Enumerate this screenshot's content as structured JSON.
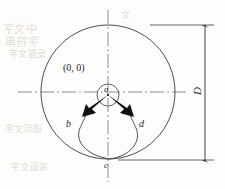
{
  "figure": {
    "labels": {
      "origin": "(0, 0)",
      "point_a": "a",
      "point_b": "b",
      "point_c": "c",
      "point_d": "d",
      "dimension_D": "D"
    },
    "colors": {
      "line": "#3a3a3a",
      "axis": "#6f6f6f",
      "arrow": "#111111",
      "background": "#fdfdfb",
      "bleed_text": "#cfc2bd"
    },
    "geometry": {
      "large_circle": {
        "cx": 108,
        "cy": 92,
        "r": 67
      },
      "small_circle": {
        "cx": 108,
        "cy": 95,
        "r": 11
      },
      "center_point": {
        "x": 108,
        "y": 95
      },
      "point_b": {
        "x": 80,
        "y": 128
      },
      "point_c": {
        "x": 110,
        "y": 159
      },
      "point_d": {
        "x": 136,
        "y": 128
      },
      "arrow_left_tip": {
        "x": 83,
        "y": 116
      },
      "arrow_right_tip": {
        "x": 133,
        "y": 116
      },
      "horizontal_axis": {
        "x1": 18,
        "x2": 186,
        "y": 92
      },
      "vertical_axis": {
        "x": 108,
        "y1": 10,
        "y2": 182
      },
      "dimension_line": {
        "x": 205,
        "y1": 25,
        "y2": 160
      },
      "extension_top": {
        "x1": 150,
        "x2": 214,
        "y": 25
      },
      "extension_bottom": {
        "x1": 118,
        "x2": 214,
        "y": 160
      }
    }
  },
  "bleed_through": {
    "line_1": "中文字",
    "line_2": "字符串",
    "line_3": "反面文字",
    "line_4": "透印文字",
    "line_5": "背面文字",
    "line_6": "文"
  }
}
